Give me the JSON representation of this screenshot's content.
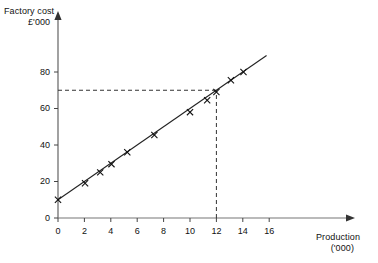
{
  "chart_data": {
    "type": "scatter",
    "title": "",
    "subtitle": "",
    "xlabel": "Production ('000)",
    "ylabel": "Factory cost £'000",
    "xlabel_line1": "Production",
    "xlabel_line2": "('000)",
    "ylabel_line1": "Factory cost",
    "ylabel_line2": "£'000",
    "xlim": [
      0,
      17.5
    ],
    "ylim": [
      0,
      92
    ],
    "grid": false,
    "legend": "none",
    "x_ticks": [
      0,
      2,
      4,
      6,
      8,
      10,
      12,
      14,
      16
    ],
    "x_tick_labels": [
      "0",
      "2",
      "4",
      "6",
      "8",
      "10",
      "12",
      "14",
      "16"
    ],
    "y_ticks": [
      0,
      20,
      40,
      60,
      80
    ],
    "y_tick_labels": [
      "0",
      "20",
      "40",
      "60",
      "80"
    ],
    "marker": "x",
    "points": [
      {
        "x": 0.0,
        "y": 10
      },
      {
        "x": 2.05,
        "y": 19
      },
      {
        "x": 3.2,
        "y": 25
      },
      {
        "x": 4.05,
        "y": 29.5
      },
      {
        "x": 5.25,
        "y": 36
      },
      {
        "x": 7.3,
        "y": 45.5
      },
      {
        "x": 10.0,
        "y": 58
      },
      {
        "x": 11.3,
        "y": 64.5
      },
      {
        "x": 12.0,
        "y": 69
      },
      {
        "x": 13.1,
        "y": 75.5
      },
      {
        "x": 14.05,
        "y": 80
      }
    ],
    "fit_line": {
      "intercept": 10,
      "slope": 5.0,
      "x_start": 0,
      "x_end": 15.8
    },
    "annotations": [
      {
        "kind": "dashed-horizontal",
        "y": 70,
        "x_from": 0,
        "x_to": 12
      },
      {
        "kind": "dashed-vertical",
        "x": 12,
        "y_from": 0,
        "y_to": 70
      }
    ]
  }
}
